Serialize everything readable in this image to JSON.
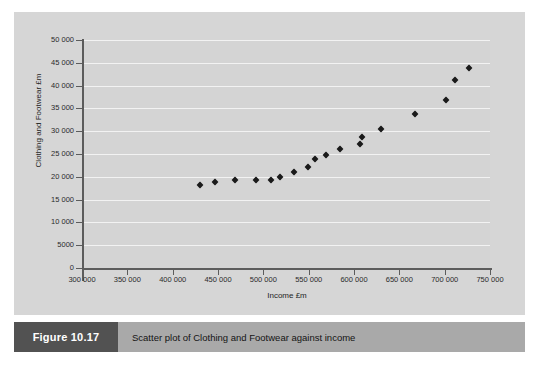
{
  "figure": {
    "number_label": "Figure 10.17",
    "caption": "Scatter plot of Clothing and Footwear against income"
  },
  "colors": {
    "panel_background": "#d6d6d6",
    "plot_background": "#d4d4d4",
    "gridline": "#f2f2f2",
    "axis": "#5c5c5c",
    "marker": "#1a1a1a",
    "caption_bar": "#a9a9a9",
    "figure_number_box": "#525252",
    "figure_number_text": "#ffffff"
  },
  "chart_data": {
    "type": "scatter",
    "title": "",
    "xlabel": "Income £m",
    "ylabel": "Clothing and Footwear £m",
    "xlim": [
      300000,
      750000
    ],
    "ylim": [
      0,
      50000
    ],
    "grid": true,
    "legend": false,
    "xticks": [
      300000,
      350000,
      400000,
      450000,
      500000,
      550000,
      600000,
      650000,
      700000,
      750000
    ],
    "xtick_labels": [
      "300 000",
      "350 000",
      "400 000",
      "450 000",
      "500 000",
      "550 000",
      "600 000",
      "650 000",
      "700 000",
      "750 000"
    ],
    "yticks": [
      0,
      5000,
      10000,
      15000,
      20000,
      25000,
      30000,
      35000,
      40000,
      45000,
      50000
    ],
    "ytick_labels": [
      "0",
      "5000",
      "10 000",
      "15 000",
      "20 000",
      "25 000",
      "30 000",
      "35 000",
      "40 000",
      "45 000",
      "50 000"
    ],
    "series": [
      {
        "name": "Clothing and Footwear vs Income",
        "marker": "diamond",
        "points": [
          {
            "x": 430000,
            "y": 18200
          },
          {
            "x": 447000,
            "y": 18900
          },
          {
            "x": 469000,
            "y": 19400
          },
          {
            "x": 492000,
            "y": 19200
          },
          {
            "x": 508000,
            "y": 19400
          },
          {
            "x": 518000,
            "y": 19900
          },
          {
            "x": 534000,
            "y": 21000
          },
          {
            "x": 549000,
            "y": 22100
          },
          {
            "x": 557000,
            "y": 23900
          },
          {
            "x": 569000,
            "y": 24900
          },
          {
            "x": 584000,
            "y": 26200
          },
          {
            "x": 607000,
            "y": 27300
          },
          {
            "x": 609000,
            "y": 28700
          },
          {
            "x": 630000,
            "y": 30400
          },
          {
            "x": 667000,
            "y": 33800
          },
          {
            "x": 701000,
            "y": 36900
          },
          {
            "x": 711000,
            "y": 41200
          },
          {
            "x": 727000,
            "y": 43900
          }
        ]
      }
    ]
  }
}
